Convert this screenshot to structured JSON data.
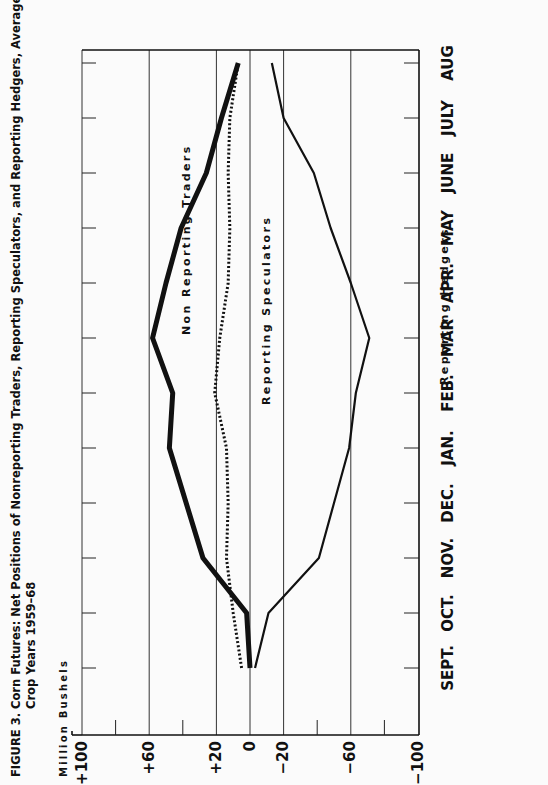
{
  "chart_data": {
    "type": "line",
    "title_line1": "FIGURE 3.   Corn Futures: Net Positions of Nonreporting Traders, Reporting Speculators, and Reporting Hedgers, Average for",
    "title_line2": "Crop Years 1959–68",
    "ylabel": "Million Bushels",
    "xlabel": "",
    "categories": [
      "SEPT.",
      "OCT.",
      "NOV.",
      "DEC.",
      "JAN.",
      "FEB.",
      "MAR",
      "APR.",
      "MAY",
      "JUNE",
      "JULY",
      "AUG"
    ],
    "ylim": [
      -100,
      100
    ],
    "y_ticks": [
      {
        "value": 100,
        "label": "+100"
      },
      {
        "value": 60,
        "label": "+60"
      },
      {
        "value": 20,
        "label": "+20"
      },
      {
        "value": 0,
        "label": "0"
      },
      {
        "value": -20,
        "label": "−20"
      },
      {
        "value": -60,
        "label": "−60"
      },
      {
        "value": -100,
        "label": "−100"
      }
    ],
    "minor_ticks": [
      80,
      40,
      -40,
      -80
    ],
    "gridlines": [
      100,
      60,
      20,
      0,
      -20,
      -60
    ],
    "orientation": "rotated 90 degrees clockwise",
    "series": [
      {
        "name": "Non Reporting Traders",
        "style": "thick-solid",
        "values": [
          0,
          2,
          28,
          38,
          48,
          46,
          58,
          50,
          41,
          26,
          17,
          7
        ]
      },
      {
        "name": "Reporting Speculators",
        "style": "dotted",
        "values": [
          5,
          10,
          14,
          13,
          14,
          21,
          18,
          13,
          12,
          13,
          12,
          7
        ]
      },
      {
        "name": "Reporting Hedgers",
        "style": "solid",
        "values": [
          -3,
          -11,
          -41,
          -50,
          -59,
          -63,
          -71,
          -60,
          -48,
          -38,
          -20,
          -13
        ]
      }
    ],
    "legend": "inline labels along each line"
  }
}
